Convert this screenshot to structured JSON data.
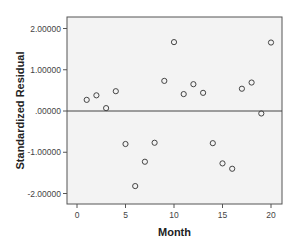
{
  "chart_data": {
    "type": "scatter",
    "title": "",
    "xlabel": "Month",
    "ylabel": "Standardized Residual",
    "xlim": [
      -1,
      21
    ],
    "ylim": [
      -2.2,
      2.3
    ],
    "x_ticks": [
      0,
      5,
      10,
      15,
      20
    ],
    "x_tick_labels": [
      "0",
      "5",
      "10",
      "15",
      "20"
    ],
    "y_ticks": [
      2,
      1,
      0,
      -1,
      -2
    ],
    "y_tick_labels": [
      "2.00000",
      "1.00000",
      ".00000",
      "-1.00000",
      "-2.00000"
    ],
    "reference_line": {
      "y": 0
    },
    "grid": false,
    "legend": null,
    "marker": "open-circle",
    "x": [
      1,
      2,
      3,
      4,
      5,
      6,
      7,
      8,
      9,
      10,
      11,
      12,
      13,
      14,
      15,
      16,
      17,
      18,
      19,
      20
    ],
    "y": [
      0.27,
      0.38,
      0.07,
      0.48,
      -0.8,
      -1.82,
      -1.23,
      -0.77,
      0.73,
      1.67,
      0.41,
      0.65,
      0.44,
      -0.78,
      -1.27,
      -1.4,
      0.54,
      0.69,
      -0.06,
      1.66
    ]
  },
  "colors": {
    "plot_background": "#f3f3f3",
    "frame": "#555555",
    "marker_stroke": "#444444",
    "reference_line": "#444444"
  }
}
